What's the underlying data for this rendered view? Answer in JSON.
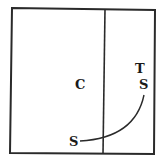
{
  "diagram": {
    "labels": {
      "c": "C",
      "t": "T",
      "s_right": "S",
      "s_bottom": "S"
    },
    "colors": {
      "stroke": "#2a2a2a",
      "background": "#ffffff"
    }
  }
}
